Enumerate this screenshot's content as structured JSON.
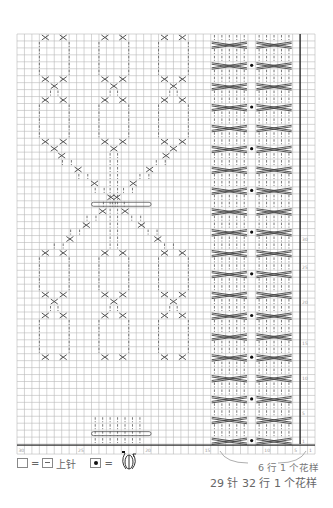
{
  "chart_data": {
    "type": "knitting-chart",
    "title": "",
    "grid": {
      "columns": 40,
      "rows": 59,
      "grid_color": "#b8b8b8"
    },
    "left_panel": {
      "description": "Three lace/cable diamond-chain columns that converge into a V (gathered with a wrap bar) and diverge again",
      "motif_columns": 3
    },
    "right_panel": {
      "description": "Two 5-stitch cable columns crossed every 6 rows with bobble dot column between",
      "cable_columns": 2,
      "cross_rows_per_repeat": 6
    },
    "x_axis_ticks": [
      "30",
      "25",
      "20",
      "15",
      "10",
      "5",
      "1"
    ],
    "y_axis_ticks": [
      "30",
      "25",
      "20",
      "15",
      "10",
      "5",
      "1"
    ],
    "legend": [
      {
        "symbol": "blank-square",
        "equals": "purl-square",
        "label": "上针"
      },
      {
        "symbol": "dot-square",
        "equals": "bobble-wrap-symbol",
        "label": ""
      }
    ],
    "annotations": [
      "6 行 1 个花样",
      "29 针 32 行 1 个花样"
    ]
  },
  "legend": {
    "eq1": "=",
    "purl_label": "上针",
    "eq2": "="
  },
  "captions": {
    "repeat_small": "6 行 1 个花样",
    "repeat_main": "29 针 32 行 1 个花样"
  }
}
